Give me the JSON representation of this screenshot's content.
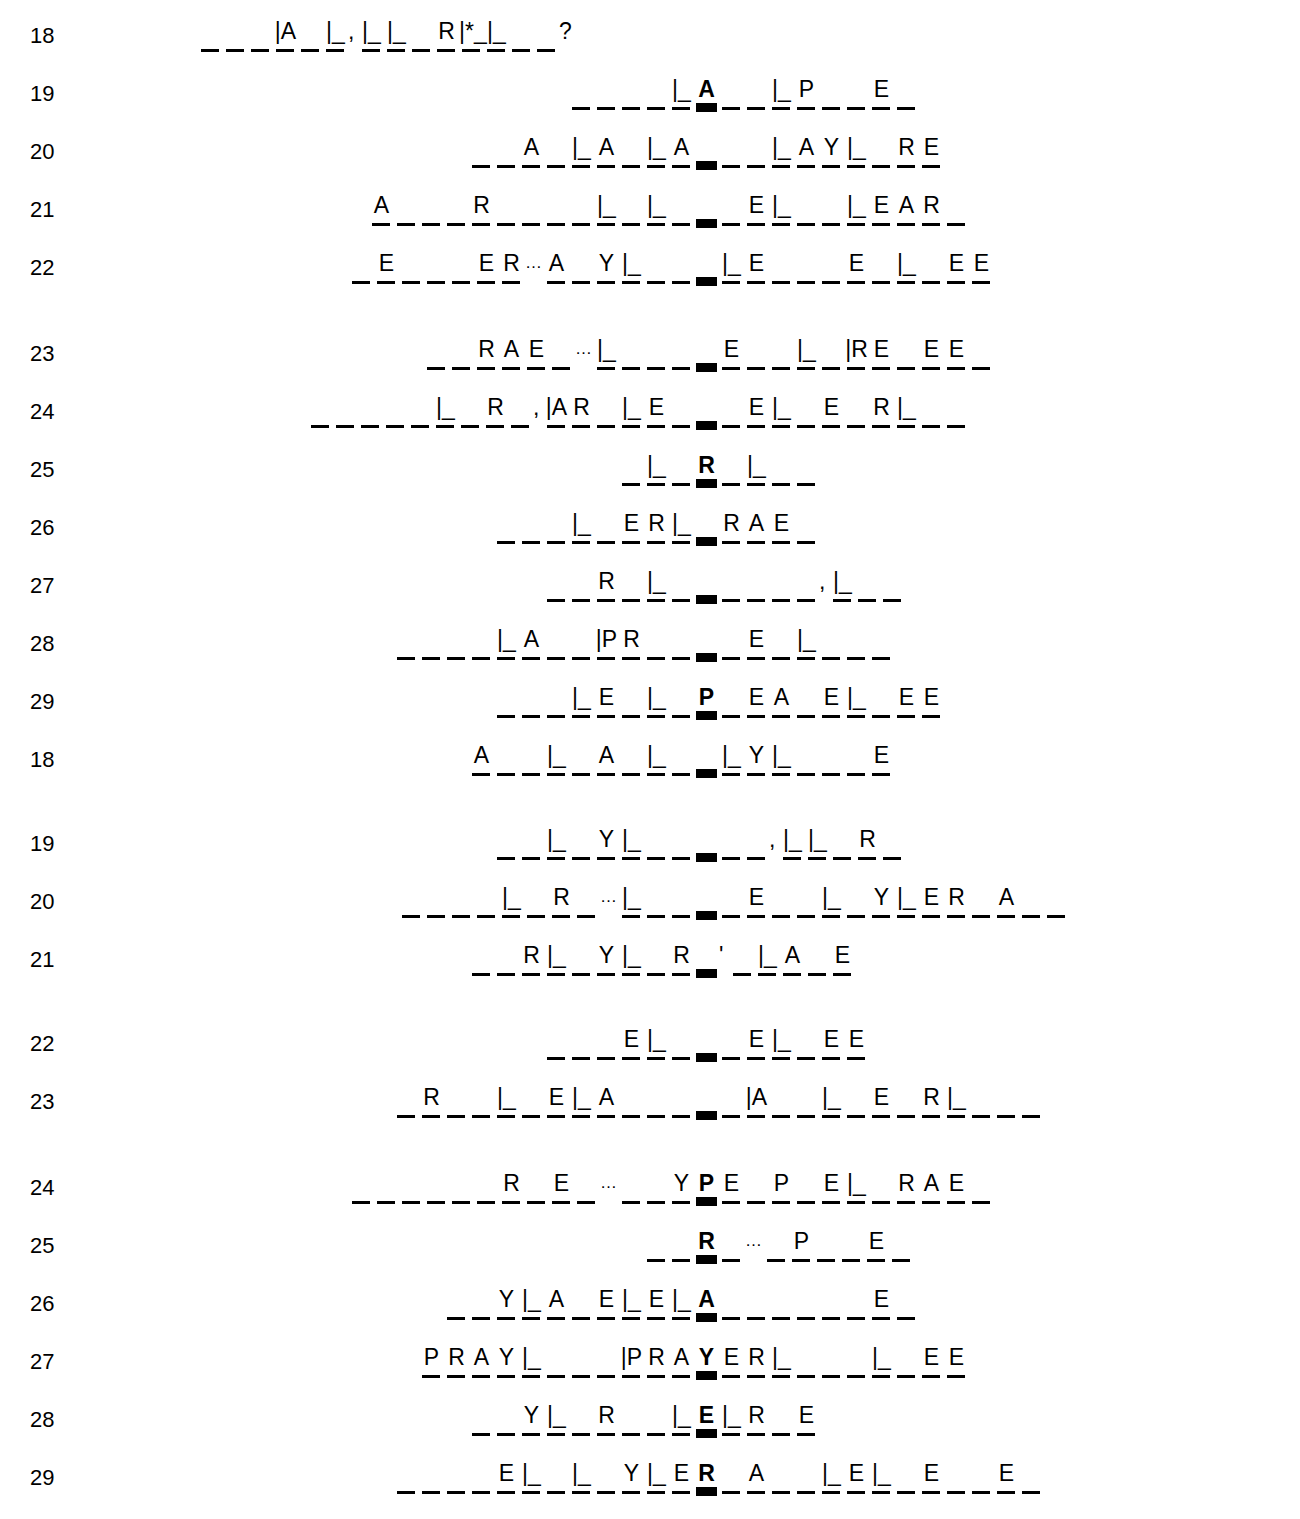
{
  "puzzle": {
    "title": "Numbered fill-in word puzzle worksheet",
    "key_column_label": "bold center column",
    "cell_width_px": 25,
    "key_column_x_px": 694,
    "rows": [
      {
        "number": "18",
        "start_x": 198,
        "cells": "_ _ _ |A _ |_ , |_ |_ _ R |*_ |_ _ _ ?"
      },
      {
        "number": "19",
        "start_x": 470,
        "cells": "_ _ _ _ |_ *A _ _ |_ P _ _ E _"
      },
      {
        "number": "20",
        "start_x": 310,
        "cells": "_ _ A _ |_ A _ |_ A *_ _ _ |_ A Y |_ _ R E"
      },
      {
        "number": "21",
        "start_x": 145,
        "cells": "A _ _ _ R _ _ _ _ |_ _ |_ _ *_ _ E |_ _ _ |_ E A R _"
      },
      {
        "number": "22",
        "start_x": 200,
        "cells": "_ E _ _ _ E R . A _ Y |_ _ _ *_ |_ E _ _ _ E _ |_ _ E E"
      },
      {
        "number": "23",
        "start_x": 310,
        "cells": "_ _ R A E _ . |_ _ _ _ *_ E _ _ |_ _ |R E _ E E _"
      },
      {
        "number": "24",
        "start_x": 90,
        "cells": "_ _ _ _ _ |_ _ R _ , |A R _ |_ E _ *_ _ E |_ _ E _ R |_ _ _"
      },
      {
        "number": "25",
        "start_x": 548,
        "cells": "_ |_ _ *R _ |_ _ _"
      },
      {
        "number": "26",
        "start_x": 340,
        "cells": "_ _ _ |_ _ E R |_ *_ R A E _"
      },
      {
        "number": "27",
        "start_x": 425,
        "cells": "_ _ R _ |_ _ *_ _ _ _ _ , |_ _ _"
      },
      {
        "number": "28",
        "start_x": 192,
        "cells": "_ _ _ _ |_ A _ _ |P R _ _ *_ _ E _ |_ _ _ _"
      },
      {
        "number": "29",
        "start_x": 318,
        "cells": "_ _ _ |_ E _ |_ _ *P _ E A _ E |_ _ E E"
      },
      {
        "number": "18",
        "start_x": 342,
        "cells": "A _ _ |_ _ A _ |_ _ *_ |_ Y |_ _ _ _ E"
      },
      {
        "number": "19",
        "start_x": 375,
        "cells": "_ _ |_ _ Y |_ _ _ *_ _ _ , |_ |_ _ R _"
      },
      {
        "number": "20",
        "start_x": 243,
        "cells": "_ _ _ _ |_ _ R _ . |_ _ _ *_ _ E _ _ |_ _ Y |_ E R _ A _ _"
      },
      {
        "number": "21",
        "start_x": 312,
        "cells": "_ _ R |_ _ Y |_ _ R *_ ' _ |_ A _ E"
      },
      {
        "number": "22",
        "start_x": 478,
        "cells": "_ _ _ E |_ _ *_ _ E |_ _ E E"
      },
      {
        "number": "23",
        "start_x": 200,
        "cells": "_ R _ _ |_ _ E |_ A _ _ _ *_ _ |A _ _ |_ _ E _ R |_ _ _ _"
      },
      {
        "number": "24",
        "start_x": 202,
        "cells": "_ _ _ _ _ _ R _ E _ . _ _ Y *P E _ P _ E |_ _ R A E _"
      },
      {
        "number": "25",
        "start_x": 620,
        "cells": "_ _ *R _ . _ P _ _ E _"
      },
      {
        "number": "26",
        "start_x": 265,
        "cells": "_ _ Y |_ A _ E |_ E |_ *A _ _ _ _ _ _ E _"
      },
      {
        "number": "27",
        "start_x": 278,
        "cells": "P R A Y |_ _ _ _ |P R A *Y E R |_ _ _ _ |_ _ E E"
      },
      {
        "number": "28",
        "start_x": 312,
        "cells": "_ _ Y |_ _ R _ _ |_ *E |_ R _ E"
      },
      {
        "number": "29",
        "start_x": 178,
        "cells": "_ _ _ _ E |_ _ |_ _ Y |_ E *R _ A _ _ |_ E |_ _ E _ _ E _"
      }
    ]
  },
  "style": {
    "ink_color": "#000000",
    "paper_color": "#ffffff"
  }
}
